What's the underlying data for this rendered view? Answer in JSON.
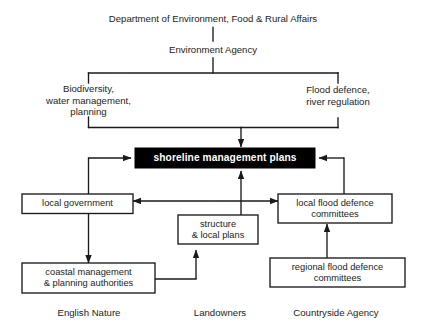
{
  "diagram": {
    "background_color": "#ffffff",
    "line_color": "#1a1a1a",
    "box_fill": "#ffffff",
    "box_border": "#1a1a1a",
    "highlight_fill": "#000000",
    "highlight_text_color": "#ffffff",
    "nodes": {
      "defra": {
        "label": "Department of Environment, Food & Rural Affairs",
        "type": "plain-text"
      },
      "environment_agency": {
        "label": "Environment Agency",
        "type": "plain-text"
      },
      "biodiversity": {
        "label": "Biodiversity,\nwater management,\nplanning",
        "type": "plain-text"
      },
      "flood_defence": {
        "label": "Flood defence,\nriver regulation",
        "type": "plain-text"
      },
      "shoreline": {
        "label": "shoreline management plans",
        "type": "highlighted-box"
      },
      "local_government": {
        "label": "local government",
        "type": "box"
      },
      "local_flood_committees": {
        "label": "local flood defence\ncommittees",
        "type": "box"
      },
      "structure_local_plans": {
        "label": "structure\n& local plans",
        "type": "box"
      },
      "coastal_management": {
        "label": "coastal management\n& planning authorities",
        "type": "box"
      },
      "regional_flood_committees": {
        "label": "regional flood defence\ncommittees",
        "type": "box"
      },
      "english_nature": {
        "label": "English Nature",
        "type": "plain-text"
      },
      "landowners": {
        "label": "Landowners",
        "type": "plain-text"
      },
      "countryside_agency": {
        "label": "Countryside Agency",
        "type": "plain-text"
      }
    },
    "edges": [
      {
        "from": "defra",
        "to": "environment_agency",
        "arrow": false
      },
      {
        "from": "environment_agency",
        "to": "biodiversity",
        "arrow": false
      },
      {
        "from": "environment_agency",
        "to": "flood_defence",
        "arrow": false
      },
      {
        "from": "biodiversity",
        "to": "shoreline",
        "arrow": true
      },
      {
        "from": "flood_defence",
        "to": "shoreline",
        "arrow": true
      },
      {
        "from": "local_government",
        "to": "shoreline",
        "arrow": true
      },
      {
        "from": "local_flood_committees",
        "to": "shoreline",
        "arrow": true
      },
      {
        "from": "structure_local_plans",
        "to": "shoreline",
        "arrow": true
      },
      {
        "from": "local_government",
        "to": "local_flood_committees",
        "arrow": true,
        "bidirectional": true
      },
      {
        "from": "local_government",
        "to": "coastal_management",
        "arrow": true
      },
      {
        "from": "coastal_management",
        "to": "structure_local_plans",
        "arrow": true
      },
      {
        "from": "regional_flood_committees",
        "to": "local_flood_committees",
        "arrow": true
      }
    ]
  }
}
